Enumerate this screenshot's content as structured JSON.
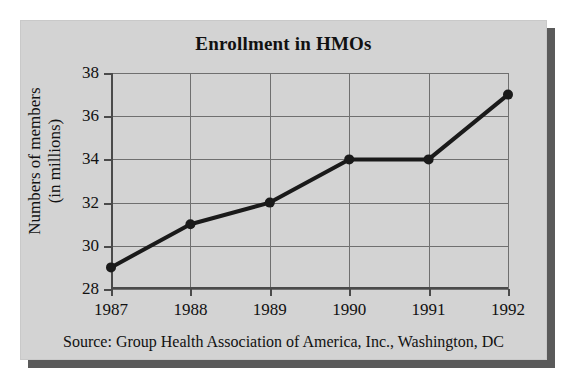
{
  "figure": {
    "title": "Enrollment in HMOs",
    "source_note": "Source: Group Health Association of America, Inc., Washington, DC",
    "y_axis_label_line1": "Numbers of members",
    "y_axis_label_line2": "(in millions)",
    "panel_color": "#d3d3d3",
    "shadow_color": "#5a5a5a",
    "grid_color": "#6f6f6f",
    "axis_color": "#4a4a4a",
    "series_color": "#1a1a1a"
  },
  "chart_data": {
    "type": "line",
    "title": "Enrollment in HMOs",
    "xlabel": "",
    "ylabel": "Numbers of members (in millions)",
    "categories": [
      "1987",
      "1988",
      "1989",
      "1990",
      "1991",
      "1992"
    ],
    "x": [
      1987,
      1988,
      1989,
      1990,
      1991,
      1992
    ],
    "values": [
      29,
      31,
      32,
      34,
      34,
      37
    ],
    "series": [
      {
        "name": "Numbers of members (in millions)",
        "values": [
          29,
          31,
          32,
          34,
          34,
          37
        ]
      }
    ],
    "ylim": [
      28,
      38
    ],
    "yticks": [
      28,
      30,
      32,
      34,
      36,
      38
    ],
    "ytick_labels": [
      "28",
      "30",
      "32",
      "34",
      "36",
      "38"
    ],
    "xtick_labels": [
      "1987",
      "1988",
      "1989",
      "1990",
      "1991",
      "1992"
    ],
    "grid": true,
    "legend": false,
    "marker": "filled-circle",
    "annotations": [
      "Source: Group Health Association of America, Inc., Washington, DC"
    ]
  }
}
